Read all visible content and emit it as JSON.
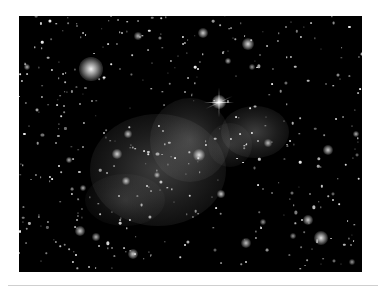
{
  "image": {
    "subject": "galaxy cluster field",
    "frame": {
      "x": 19,
      "y": 16,
      "w": 343,
      "h": 256
    },
    "background_color": "#000000",
    "page_color": "#ffffff",
    "diffuse_glows": [
      {
        "cx": 158,
        "cy": 170,
        "rx": 68,
        "ry": 56,
        "alpha": 0.3
      },
      {
        "cx": 190,
        "cy": 140,
        "rx": 40,
        "ry": 42,
        "alpha": 0.28
      },
      {
        "cx": 255,
        "cy": 132,
        "rx": 34,
        "ry": 26,
        "alpha": 0.3
      },
      {
        "cx": 230,
        "cy": 145,
        "rx": 22,
        "ry": 22,
        "alpha": 0.2
      },
      {
        "cx": 125,
        "cy": 200,
        "rx": 40,
        "ry": 26,
        "alpha": 0.16
      }
    ],
    "halo_sources": [
      {
        "x": 91,
        "y": 69,
        "r": 12,
        "alpha": 0.95
      },
      {
        "x": 219,
        "y": 102,
        "r": 7,
        "alpha": 1.0
      },
      {
        "x": 248,
        "y": 44,
        "r": 6,
        "alpha": 0.85
      },
      {
        "x": 203,
        "y": 33,
        "r": 5,
        "alpha": 0.8
      },
      {
        "x": 199,
        "y": 155,
        "r": 6,
        "alpha": 0.85
      },
      {
        "x": 117,
        "y": 154,
        "r": 5,
        "alpha": 0.8
      },
      {
        "x": 328,
        "y": 150,
        "r": 5,
        "alpha": 0.8
      },
      {
        "x": 321,
        "y": 238,
        "r": 7,
        "alpha": 0.9
      },
      {
        "x": 308,
        "y": 220,
        "r": 5,
        "alpha": 0.8
      },
      {
        "x": 246,
        "y": 243,
        "r": 5,
        "alpha": 0.75
      },
      {
        "x": 80,
        "y": 231,
        "r": 5,
        "alpha": 0.8
      },
      {
        "x": 133,
        "y": 254,
        "r": 5,
        "alpha": 0.8
      },
      {
        "x": 96,
        "y": 237,
        "r": 4,
        "alpha": 0.7
      },
      {
        "x": 221,
        "y": 194,
        "r": 4,
        "alpha": 0.8
      },
      {
        "x": 138,
        "y": 36,
        "r": 4,
        "alpha": 0.7
      },
      {
        "x": 128,
        "y": 134,
        "r": 4,
        "alpha": 0.75
      },
      {
        "x": 126,
        "y": 181,
        "r": 4,
        "alpha": 0.75
      },
      {
        "x": 157,
        "y": 175,
        "r": 3,
        "alpha": 0.7
      },
      {
        "x": 268,
        "y": 143,
        "r": 4,
        "alpha": 0.7
      },
      {
        "x": 356,
        "y": 134,
        "r": 3,
        "alpha": 0.7
      },
      {
        "x": 27,
        "y": 67,
        "r": 3,
        "alpha": 0.7
      },
      {
        "x": 69,
        "y": 160,
        "r": 3,
        "alpha": 0.7
      },
      {
        "x": 83,
        "y": 188,
        "r": 3,
        "alpha": 0.7
      },
      {
        "x": 228,
        "y": 61,
        "r": 3,
        "alpha": 0.7
      },
      {
        "x": 252,
        "y": 67,
        "r": 3,
        "alpha": 0.6
      },
      {
        "x": 293,
        "y": 236,
        "r": 3,
        "alpha": 0.6
      },
      {
        "x": 352,
        "y": 262,
        "r": 3,
        "alpha": 0.6
      },
      {
        "x": 263,
        "y": 222,
        "r": 3,
        "alpha": 0.6
      }
    ],
    "diffraction_star": {
      "x": 219,
      "y": 102,
      "spike_len": 30
    },
    "random_field_seed": 7,
    "random_field_count": 420
  }
}
